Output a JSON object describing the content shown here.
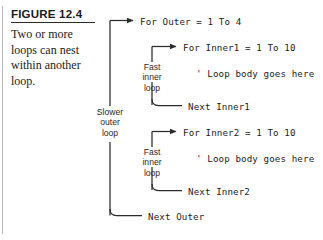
{
  "caption": {
    "figure_label": "FIGURE 12.4",
    "description": "Two or more loops can nest within another loop."
  },
  "diagram": {
    "outer_label": "Slower\nouter\nloop",
    "inner_label_1": "Fast\ninner\nloop",
    "inner_label_2": "Fast\ninner\nloop",
    "code": {
      "for_outer": "For Outer = 1 To 4",
      "for_inner1": "For Inner1 = 1 To 10",
      "comment1": "' Loop body goes here",
      "next_inner1": "Next Inner1",
      "for_inner2": "For Inner2 = 1 To 10",
      "comment2": "' Loop body goes here",
      "next_inner2": "Next Inner2",
      "next_outer": "Next Outer"
    }
  },
  "colors": {
    "line": "#2b2b2b",
    "text": "#1c1c1c",
    "rule": "#b9b9b9"
  }
}
